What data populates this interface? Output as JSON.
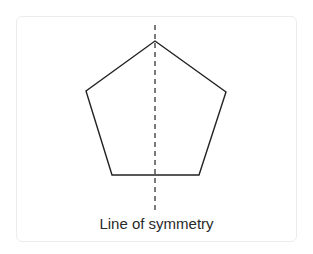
{
  "diagram": {
    "shape": "regular pentagon",
    "caption": "Line of symmetry",
    "stroke_color": "#222222",
    "vertices": [
      [
        155,
        41
      ],
      [
        226,
        92
      ],
      [
        199,
        175
      ],
      [
        112,
        175
      ],
      [
        86,
        91
      ]
    ],
    "symmetry_line": {
      "x": 155,
      "y1": 25,
      "y2": 212,
      "style": "dashed"
    }
  }
}
